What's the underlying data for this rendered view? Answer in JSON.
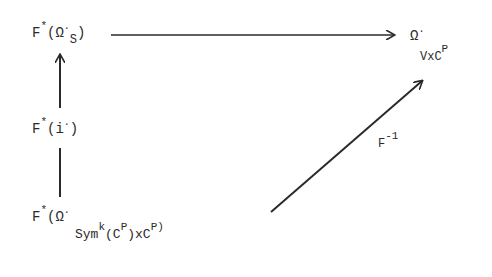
{
  "diagram": {
    "type": "commutative-diagram",
    "nodes": {
      "top_left": {
        "base": "F",
        "sup": "*",
        "open": "(",
        "symbol": "Ω",
        "dot": "·",
        "sub": "S",
        "close": ")"
      },
      "middle_left": {
        "base": "F",
        "sup": "*",
        "open": "(",
        "symbol": "i",
        "dot": "·",
        "close": ")"
      },
      "bottom_left": {
        "base": "F",
        "sup": "*",
        "open": "(",
        "symbol": "Ω",
        "dot": "·",
        "sub_base": "Sym",
        "sub_sup": "k",
        "sub_open": "(",
        "sub_c1": "C",
        "sub_c1_sup": "P",
        "sub_close_x": ")x",
        "sub_c2": "C",
        "sub_c2_sup": "P",
        "close": ")"
      },
      "top_right": {
        "symbol": "Ω",
        "dot": "·",
        "sub_v": "V",
        "sub_x": "x",
        "sub_c": "C",
        "sub_c_sup": "P"
      }
    },
    "arrows": {
      "horizontal": {
        "from": "top_left",
        "to": "top_right",
        "label": ""
      },
      "vertical_up": {
        "from": "middle_left",
        "to": "top_left",
        "label": ""
      },
      "vertical_line": {
        "from": "bottom_left",
        "to": "middle_left",
        "label": ""
      },
      "diagonal": {
        "from": "bottom_left",
        "to": "top_right",
        "label_base": "F",
        "label_sup": "-1"
      }
    },
    "colors": {
      "ink": "#2a2a2a",
      "background": "#ffffff"
    }
  }
}
